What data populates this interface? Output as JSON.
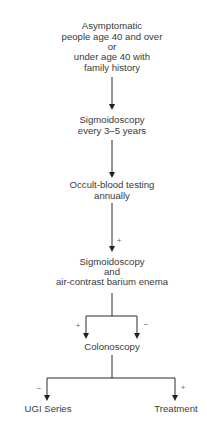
{
  "diagram": {
    "type": "flowchart",
    "nodes": {
      "start": [
        "Asymptomatic",
        "people age 40 and over",
        "or",
        "under age 40 with",
        "family history"
      ],
      "sigmoidoscopy_periodic": [
        "Sigmoidoscopy",
        "every 3–5 years"
      ],
      "occult_blood": [
        "Occult-blood testing",
        "annually"
      ],
      "sigmoidoscopy_barium": [
        "Sigmoidoscopy",
        "and",
        "air-contrast barium enema"
      ],
      "colonoscopy": [
        "Colonoscopy"
      ],
      "ugi_series": [
        "UGI Series"
      ],
      "treatment": [
        "Treatment"
      ]
    },
    "edges": [
      {
        "from": "start",
        "to": "sigmoidoscopy_periodic",
        "label": ""
      },
      {
        "from": "sigmoidoscopy_periodic",
        "to": "occult_blood",
        "label": ""
      },
      {
        "from": "occult_blood",
        "to": "sigmoidoscopy_barium",
        "label": "+"
      },
      {
        "from": "sigmoidoscopy_barium",
        "to": "colonoscopy",
        "label": "+"
      },
      {
        "from": "sigmoidoscopy_barium",
        "to": "colonoscopy",
        "label": "−"
      },
      {
        "from": "colonoscopy",
        "to": "ugi_series",
        "label": "−"
      },
      {
        "from": "colonoscopy",
        "to": "treatment",
        "label": "+"
      }
    ],
    "colors": {
      "line": "#2a2a2a",
      "text": "#3a3a3a",
      "sign": "#666666"
    }
  }
}
